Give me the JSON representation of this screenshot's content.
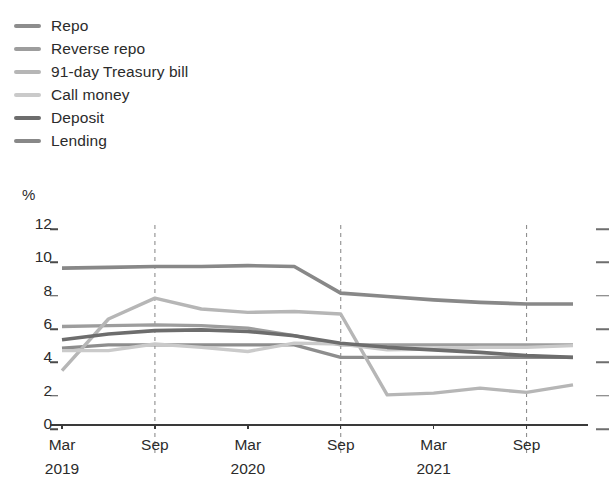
{
  "legend": {
    "position": "top-left",
    "items": [
      {
        "label": "Repo",
        "color": "#8d8d8d",
        "key": "repo"
      },
      {
        "label": "Reverse repo",
        "color": "#9d9d9d",
        "key": "reverse_repo"
      },
      {
        "label": "91-day Treasury bill",
        "color": "#b6b6b6",
        "key": "tbill_91"
      },
      {
        "label": "Call money",
        "color": "#cacaca",
        "key": "call_money"
      },
      {
        "label": "Deposit",
        "color": "#6d6d6d",
        "key": "deposit"
      },
      {
        "label": "Lending",
        "color": "#888888",
        "key": "lending"
      }
    ]
  },
  "axes": {
    "y_unit_label": "%",
    "y_ticks": [
      0,
      2,
      4,
      6,
      8,
      10,
      12
    ],
    "y_tick_labels": [
      "0",
      "2",
      "4",
      "6",
      "8",
      "10",
      "12"
    ],
    "ylim": [
      0,
      12
    ],
    "x_tick_labels": [
      "Mar",
      "Sep",
      "Mar",
      "Sep",
      "Mar",
      "Sep"
    ],
    "x_tick_years": [
      "2019",
      "",
      "2020",
      "",
      "2021",
      ""
    ],
    "grid": "vertical-dashed-annual"
  },
  "chart_data": {
    "type": "line",
    "title": "",
    "subtitle": "",
    "xlabel": "",
    "ylabel": "%",
    "ylim": [
      0,
      12
    ],
    "grid": false,
    "legend_position": "top-left",
    "x": [
      "Mar 2019",
      "Jun 2019",
      "Sep 2019",
      "Dec 2019",
      "Mar 2020",
      "Jun 2020",
      "Sep 2020",
      "Dec 2020",
      "Mar 2021",
      "Jun 2021",
      "Sep 2021",
      "Dec 2021"
    ],
    "categories": [
      "Mar 2019",
      "Jun 2019",
      "Sep 2019",
      "Dec 2019",
      "Mar 2020",
      "Jun 2020",
      "Sep 2020",
      "Dec 2020",
      "Mar 2021",
      "Jun 2021",
      "Sep 2021",
      "Dec 2021"
    ],
    "series": [
      {
        "name": "Repo",
        "color": "#8d8d8d",
        "width": 3.4,
        "values": [
          4.55,
          4.75,
          4.75,
          4.75,
          4.75,
          4.75,
          4.0,
          4.0,
          4.0,
          4.0,
          4.0,
          4.0
        ]
      },
      {
        "name": "Reverse repo",
        "color": "#9d9d9d",
        "width": 3.4,
        "values": [
          5.85,
          5.9,
          5.95,
          5.9,
          5.75,
          5.3,
          4.75,
          4.75,
          4.75,
          4.75,
          4.75,
          4.75
        ]
      },
      {
        "name": "91-day Treasury bill",
        "color": "#b6b6b6",
        "width": 3.4,
        "values": [
          3.2,
          6.3,
          7.55,
          6.9,
          6.7,
          6.75,
          6.6,
          1.75,
          1.85,
          2.15,
          1.9,
          2.35
        ]
      },
      {
        "name": "Call money",
        "color": "#cacaca",
        "width": 3.4,
        "values": [
          4.4,
          4.4,
          4.8,
          4.6,
          4.35,
          4.85,
          4.8,
          4.45,
          4.5,
          4.6,
          4.6,
          4.7
        ]
      },
      {
        "name": "Deposit",
        "color": "#6d6d6d",
        "width": 3.6,
        "values": [
          5.05,
          5.4,
          5.6,
          5.65,
          5.55,
          5.3,
          4.85,
          4.6,
          4.45,
          4.3,
          4.1,
          4.0
        ]
      },
      {
        "name": "Lending",
        "color": "#888888",
        "width": 3.6,
        "values": [
          9.35,
          9.4,
          9.45,
          9.45,
          9.5,
          9.45,
          7.85,
          7.65,
          7.45,
          7.3,
          7.2,
          7.2
        ]
      }
    ],
    "annotations": [
      {
        "type": "vline",
        "x": "Sep 2019",
        "style": "dashed"
      },
      {
        "type": "vline",
        "x": "Sep 2020",
        "style": "dashed"
      },
      {
        "type": "vline",
        "x": "Sep 2021",
        "style": "dashed"
      }
    ]
  }
}
